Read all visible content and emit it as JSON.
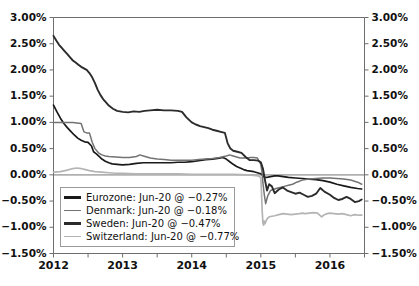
{
  "chart_data": {
    "type": "line",
    "title": "",
    "subtitle": "",
    "xlabel": "",
    "ylabel": "",
    "ylim": [
      -1.5,
      3.0
    ],
    "xlim": [
      2012.0,
      2016.5
    ],
    "grid": false,
    "zero_line": true,
    "legend_position": "lower-left",
    "y_ticks": [
      "3.00%",
      "2.50%",
      "2.00%",
      "1.50%",
      "1.00%",
      "0.50%",
      "0.00%",
      "-0.50%",
      "-1.00%",
      "-1.50%"
    ],
    "y_tick_values": [
      3.0,
      2.5,
      2.0,
      1.5,
      1.0,
      0.5,
      0.0,
      -0.5,
      -1.0,
      -1.5
    ],
    "y_axis_right_ticks": [
      "3.00%",
      "2.50%",
      "2.00%",
      "1.50%",
      "1.00%",
      "0.50%",
      "0.00%",
      "-0.50%",
      "-1.00%",
      "-1.50%"
    ],
    "x_ticks": [
      "2012",
      "2013",
      "2014",
      "2015",
      "2016"
    ],
    "x_tick_values": [
      2012,
      2013,
      2014,
      2015,
      2016
    ],
    "x_minor_tick_values": [
      2012.5,
      2013.5,
      2014.5,
      2015.5,
      2016.5
    ],
    "series": [
      {
        "name": "Eurozone",
        "legend_label": "Eurozone: Jun-20 @ -0.27%",
        "color": "#1a1a1a",
        "width": 1.7,
        "last_value": -0.27,
        "x": [
          2012.0,
          2012.05,
          2012.1,
          2012.15,
          2012.2,
          2012.25,
          2012.3,
          2012.35,
          2012.4,
          2012.45,
          2012.5,
          2012.55,
          2012.58,
          2012.62,
          2012.66,
          2012.7,
          2012.75,
          2012.8,
          2012.85,
          2012.92,
          2013.0,
          2013.1,
          2013.2,
          2013.3,
          2013.4,
          2013.5,
          2013.6,
          2013.7,
          2013.8,
          2013.9,
          2014.0,
          2014.1,
          2014.2,
          2014.3,
          2014.4,
          2014.45,
          2014.5,
          2014.55,
          2014.6,
          2014.65,
          2014.7,
          2014.75,
          2014.8,
          2014.85,
          2014.9,
          2014.95,
          2015.0,
          2015.02,
          2015.04,
          2015.06,
          2015.08,
          2015.12,
          2015.16,
          2015.2,
          2015.25,
          2015.3,
          2015.35,
          2015.4,
          2015.5,
          2015.6,
          2015.7,
          2015.8,
          2015.9,
          2016.0,
          2016.1,
          2016.2,
          2016.3,
          2016.4,
          2016.46
        ],
        "y": [
          1.33,
          1.2,
          1.08,
          0.98,
          0.9,
          0.83,
          0.76,
          0.7,
          0.66,
          0.63,
          0.62,
          0.55,
          0.44,
          0.4,
          0.35,
          0.3,
          0.26,
          0.23,
          0.21,
          0.2,
          0.19,
          0.2,
          0.22,
          0.23,
          0.23,
          0.23,
          0.23,
          0.23,
          0.24,
          0.24,
          0.25,
          0.27,
          0.29,
          0.3,
          0.32,
          0.33,
          0.3,
          0.25,
          0.2,
          0.16,
          0.13,
          0.1,
          0.08,
          0.07,
          0.06,
          0.04,
          0.02,
          0.0,
          -0.03,
          -0.05,
          -0.05,
          -0.04,
          -0.03,
          -0.02,
          -0.02,
          -0.03,
          -0.04,
          -0.05,
          -0.06,
          -0.07,
          -0.08,
          -0.09,
          -0.11,
          -0.14,
          -0.18,
          -0.21,
          -0.24,
          -0.26,
          -0.27
        ]
      },
      {
        "name": "Denmark",
        "legend_label": "Denmark: Jun-20 @ -0.18%",
        "color": "#737373",
        "width": 1.5,
        "last_value": -0.18,
        "x": [
          2012.0,
          2012.1,
          2012.2,
          2012.28,
          2012.34,
          2012.4,
          2012.44,
          2012.48,
          2012.52,
          2012.56,
          2012.6,
          2012.65,
          2012.7,
          2012.75,
          2012.8,
          2012.9,
          2013.0,
          2013.1,
          2013.2,
          2013.25,
          2013.3,
          2013.4,
          2013.5,
          2013.6,
          2013.7,
          2013.8,
          2013.9,
          2014.0,
          2014.1,
          2014.2,
          2014.3,
          2014.4,
          2014.5,
          2014.55,
          2014.6,
          2014.65,
          2014.7,
          2014.75,
          2014.8,
          2014.85,
          2014.9,
          2014.95,
          2015.0,
          2015.02,
          2015.03,
          2015.05,
          2015.07,
          2015.1,
          2015.14,
          2015.18,
          2015.22,
          2015.28,
          2015.34,
          2015.4,
          2015.46,
          2015.52,
          2015.6,
          2015.7,
          2015.8,
          2015.9,
          2016.0,
          2016.1,
          2016.2,
          2016.3,
          2016.4,
          2016.46
        ],
        "y": [
          1.0,
          1.0,
          1.0,
          1.0,
          0.99,
          0.98,
          0.82,
          0.8,
          0.8,
          0.62,
          0.5,
          0.42,
          0.38,
          0.36,
          0.35,
          0.34,
          0.33,
          0.33,
          0.35,
          0.38,
          0.36,
          0.32,
          0.3,
          0.29,
          0.28,
          0.28,
          0.28,
          0.28,
          0.29,
          0.3,
          0.31,
          0.33,
          0.36,
          0.38,
          0.36,
          0.34,
          0.32,
          0.32,
          0.32,
          0.33,
          0.33,
          0.32,
          0.2,
          0.02,
          -0.15,
          -0.38,
          -0.55,
          -0.4,
          -0.3,
          -0.28,
          -0.26,
          -0.24,
          -0.22,
          -0.2,
          -0.18,
          -0.14,
          -0.1,
          -0.08,
          -0.07,
          -0.06,
          -0.06,
          -0.07,
          -0.08,
          -0.1,
          -0.14,
          -0.18
        ]
      },
      {
        "name": "Sweden",
        "legend_label": "Sweden: Jun-20 @ -0.47%",
        "color": "#2b2b2b",
        "width": 1.9,
        "last_value": -0.47,
        "x": [
          2012.0,
          2012.04,
          2012.08,
          2012.12,
          2012.16,
          2012.2,
          2012.24,
          2012.28,
          2012.32,
          2012.36,
          2012.4,
          2012.44,
          2012.48,
          2012.52,
          2012.56,
          2012.6,
          2012.64,
          2012.68,
          2012.72,
          2012.76,
          2012.8,
          2012.86,
          2012.92,
          2013.0,
          2013.08,
          2013.16,
          2013.24,
          2013.32,
          2013.4,
          2013.5,
          2013.6,
          2013.7,
          2013.8,
          2013.86,
          2013.92,
          2014.0,
          2014.06,
          2014.12,
          2014.18,
          2014.24,
          2014.3,
          2014.36,
          2014.42,
          2014.48,
          2014.52,
          2014.56,
          2014.6,
          2014.66,
          2014.72,
          2014.78,
          2014.84,
          2014.9,
          2014.96,
          2015.0,
          2015.03,
          2015.06,
          2015.09,
          2015.12,
          2015.16,
          2015.2,
          2015.26,
          2015.32,
          2015.38,
          2015.44,
          2015.5,
          2015.56,
          2015.62,
          2015.68,
          2015.74,
          2015.8,
          2015.86,
          2015.92,
          2016.0,
          2016.06,
          2016.12,
          2016.18,
          2016.24,
          2016.3,
          2016.36,
          2016.42,
          2016.46
        ],
        "y": [
          2.65,
          2.56,
          2.48,
          2.42,
          2.36,
          2.3,
          2.24,
          2.18,
          2.14,
          2.1,
          2.06,
          2.03,
          2.0,
          1.94,
          1.86,
          1.75,
          1.62,
          1.52,
          1.44,
          1.38,
          1.32,
          1.26,
          1.22,
          1.2,
          1.19,
          1.21,
          1.2,
          1.22,
          1.23,
          1.24,
          1.23,
          1.23,
          1.22,
          1.2,
          1.1,
          1.0,
          0.96,
          0.93,
          0.91,
          0.89,
          0.86,
          0.84,
          0.82,
          0.8,
          0.6,
          0.5,
          0.46,
          0.44,
          0.42,
          0.34,
          0.28,
          0.28,
          0.27,
          0.24,
          0.12,
          -0.1,
          -0.3,
          -0.18,
          -0.22,
          -0.35,
          -0.28,
          -0.24,
          -0.3,
          -0.33,
          -0.36,
          -0.34,
          -0.38,
          -0.42,
          -0.4,
          -0.36,
          -0.25,
          -0.32,
          -0.38,
          -0.44,
          -0.48,
          -0.46,
          -0.42,
          -0.46,
          -0.52,
          -0.5,
          -0.47
        ]
      },
      {
        "name": "Switzerland",
        "legend_label": "Switzerland: Jun-20 @ -0.77%",
        "color": "#b4b4b4",
        "width": 1.7,
        "last_value": -0.77,
        "x": [
          2012.0,
          2012.1,
          2012.2,
          2012.28,
          2012.34,
          2012.4,
          2012.46,
          2012.52,
          2012.6,
          2012.7,
          2012.8,
          2012.9,
          2013.0,
          2013.2,
          2013.4,
          2013.6,
          2013.8,
          2014.0,
          2014.2,
          2014.4,
          2014.6,
          2014.8,
          2014.9,
          2014.96,
          2015.0,
          2015.01,
          2015.02,
          2015.03,
          2015.04,
          2015.05,
          2015.06,
          2015.07,
          2015.09,
          2015.12,
          2015.16,
          2015.2,
          2015.26,
          2015.32,
          2015.38,
          2015.44,
          2015.5,
          2015.56,
          2015.6,
          2015.64,
          2015.7,
          2015.76,
          2015.82,
          2015.88,
          2015.92,
          2015.96,
          2016.0,
          2016.06,
          2016.12,
          2016.18,
          2016.24,
          2016.3,
          2016.36,
          2016.42,
          2016.46
        ],
        "y": [
          0.05,
          0.06,
          0.09,
          0.12,
          0.13,
          0.12,
          0.1,
          0.08,
          0.06,
          0.05,
          0.04,
          0.03,
          0.03,
          0.02,
          0.02,
          0.02,
          0.02,
          0.01,
          0.01,
          0.01,
          0.01,
          0.0,
          -0.01,
          -0.02,
          -0.05,
          -0.35,
          -0.7,
          -0.92,
          -0.96,
          -0.88,
          -0.93,
          -0.9,
          -0.84,
          -0.8,
          -0.79,
          -0.78,
          -0.76,
          -0.74,
          -0.75,
          -0.76,
          -0.75,
          -0.74,
          -0.73,
          -0.74,
          -0.73,
          -0.72,
          -0.73,
          -0.8,
          -0.76,
          -0.74,
          -0.73,
          -0.74,
          -0.75,
          -0.74,
          -0.76,
          -0.78,
          -0.76,
          -0.77,
          -0.77
        ]
      }
    ]
  },
  "legend": {
    "items": [
      {
        "label": "Eurozone: Jun-20 @ -0.27%",
        "color": "#1a1a1a",
        "width": 2.4
      },
      {
        "label": "Denmark: Jun-20 @ -0.18%",
        "color": "#737373",
        "width": 1.8
      },
      {
        "label": "Sweden: Jun-20 @ -0.47%",
        "color": "#2b2b2b",
        "width": 2.6
      },
      {
        "label": "Switzerland: Jun-20 @ -0.77%",
        "color": "#b4b4b4",
        "width": 1.8
      }
    ]
  },
  "colors": {
    "axis": "#555555",
    "frame": "#6e6e6e",
    "zero_line": "#b0b0b0",
    "background": "#ffffff",
    "text": "#111111"
  }
}
